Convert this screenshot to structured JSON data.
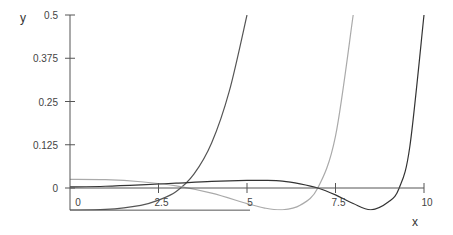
{
  "chart_data": {
    "type": "line",
    "title": "",
    "xlabel": "x",
    "ylabel": "y",
    "xlim": [
      0,
      10
    ],
    "ylim": [
      -0.064,
      0.5
    ],
    "grid": false,
    "legend": null,
    "x_ticks": [
      "0",
      "2.5",
      "5",
      "7.5",
      "10"
    ],
    "y_ticks": [
      "0",
      "0.125",
      "0.25",
      "0.375",
      "0.5"
    ],
    "series": [
      {
        "name": "curve-1",
        "color": "#555555",
        "x": [
          0,
          1,
          2,
          2.5,
          3,
          3.5,
          4,
          4.5,
          5.0
        ],
        "y": [
          -0.064,
          -0.062,
          -0.05,
          -0.035,
          -0.01,
          0.04,
          0.13,
          0.28,
          0.5
        ]
      },
      {
        "name": "curve-2",
        "color": "#aaaaaa",
        "x": [
          0,
          1,
          2,
          3,
          4,
          5,
          5.5,
          6,
          6.5,
          7,
          7.5,
          8.0
        ],
        "y": [
          0.025,
          0.024,
          0.018,
          0.006,
          -0.015,
          -0.045,
          -0.058,
          -0.063,
          -0.05,
          0.0,
          0.15,
          0.5
        ]
      },
      {
        "name": "curve-3",
        "color": "#333333",
        "x": [
          0,
          1,
          2,
          3,
          4,
          5,
          5.5,
          6,
          6.5,
          7,
          7.5,
          8,
          8.5,
          9,
          9.3,
          9.6,
          10
        ],
        "y": [
          0.003,
          0.005,
          0.009,
          0.014,
          0.019,
          0.022,
          0.022,
          0.02,
          0.012,
          0.0,
          -0.02,
          -0.045,
          -0.063,
          -0.04,
          0.0,
          0.12,
          0.5
        ]
      }
    ]
  },
  "axes": {
    "x_label": "x",
    "y_label": "y"
  }
}
